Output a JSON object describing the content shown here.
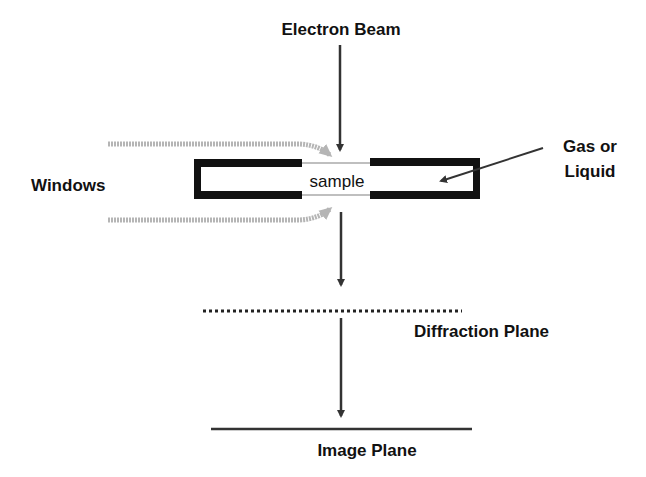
{
  "labels": {
    "electron_beam": "Electron Beam",
    "windows": "Windows",
    "sample": "sample",
    "gas_line1": "Gas or",
    "gas_line2": "Liquid",
    "diffraction_plane": "Diffraction Plane",
    "image_plane": "Image Plane"
  },
  "colors": {
    "ink": "#111111",
    "arrow": "#333333",
    "window_arrow": "#b0b0b0",
    "membrane": "#aaaaaa"
  }
}
